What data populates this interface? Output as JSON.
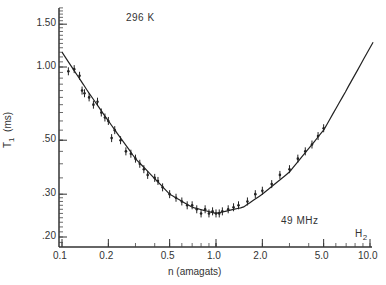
{
  "chart_data": {
    "type": "scatter",
    "title": "",
    "annotations": [
      "296 K",
      "49 MHz",
      "H2"
    ],
    "xlabel": "n (amagats)",
    "ylabel": "T1 (ms)",
    "xscale": "log",
    "yscale": "log",
    "xlim": [
      0.1,
      10.0
    ],
    "ylim": [
      0.18,
      1.8
    ],
    "xticks": [
      "0.1",
      "0.2",
      "0.5",
      "1.0",
      "2.0",
      "5.0",
      "10.0"
    ],
    "yticks": [
      "1.50",
      "1.00",
      ".50",
      ".30",
      ".20"
    ],
    "grid": false,
    "series": [
      {
        "name": "measured T1 (with error bars)",
        "x": [
          0.11,
          0.12,
          0.13,
          0.135,
          0.14,
          0.15,
          0.16,
          0.17,
          0.18,
          0.19,
          0.2,
          0.21,
          0.22,
          0.24,
          0.26,
          0.28,
          0.3,
          0.32,
          0.34,
          0.36,
          0.4,
          0.42,
          0.45,
          0.5,
          0.55,
          0.6,
          0.65,
          0.7,
          0.75,
          0.8,
          0.85,
          0.9,
          0.95,
          1.0,
          1.05,
          1.1,
          1.2,
          1.3,
          1.4,
          1.6,
          1.8,
          2.0,
          2.3,
          2.6,
          3.0,
          3.4,
          3.8,
          4.2,
          4.6,
          5.0
        ],
        "y": [
          0.96,
          0.98,
          0.92,
          0.8,
          0.78,
          0.75,
          0.7,
          0.72,
          0.65,
          0.62,
          0.6,
          0.51,
          0.55,
          0.5,
          0.45,
          0.44,
          0.42,
          0.4,
          0.38,
          0.36,
          0.35,
          0.34,
          0.32,
          0.3,
          0.29,
          0.28,
          0.27,
          0.27,
          0.26,
          0.25,
          0.26,
          0.25,
          0.255,
          0.25,
          0.25,
          0.255,
          0.26,
          0.265,
          0.27,
          0.28,
          0.3,
          0.31,
          0.33,
          0.36,
          0.38,
          0.42,
          0.45,
          0.48,
          0.52,
          0.56
        ]
      },
      {
        "name": "fit curve",
        "x": [
          0.1,
          0.15,
          0.2,
          0.3,
          0.5,
          0.7,
          1.0,
          1.5,
          2.0,
          3.0,
          5.0,
          7.0,
          10.0
        ],
        "y": [
          1.15,
          0.78,
          0.6,
          0.42,
          0.3,
          0.265,
          0.25,
          0.265,
          0.3,
          0.37,
          0.55,
          0.8,
          1.2
        ]
      }
    ]
  },
  "labels": {
    "temp": "296 K",
    "freq": "49 MHz",
    "gas": "H",
    "gas_sub": "2",
    "ylabel": "T",
    "ylabel_sub": "1",
    "ylabel_unit": "(ms)",
    "xlabel": "n (amagats)"
  }
}
